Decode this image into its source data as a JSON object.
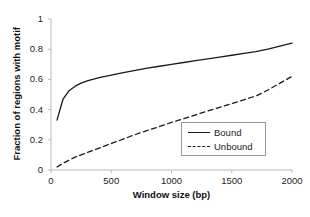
{
  "chart_data": {
    "type": "line",
    "title": "",
    "xlabel": "Window size (bp)",
    "ylabel": "Fraction of regions with motif",
    "xlim": [
      0,
      2000
    ],
    "ylim": [
      0,
      1
    ],
    "xticks": [
      0,
      500,
      1000,
      1500,
      2000
    ],
    "yticks": [
      0,
      0.2,
      0.4,
      0.6,
      0.8,
      1
    ],
    "xtick_labels": [
      "0",
      "500",
      "1000",
      "1500",
      "2000"
    ],
    "ytick_labels": [
      "0",
      "0.2",
      "0.4",
      "0.6",
      "0.8",
      "1"
    ],
    "grid": false,
    "legend_position": "inside-lower-right",
    "x": [
      50,
      100,
      150,
      200,
      250,
      300,
      400,
      500,
      600,
      700,
      800,
      900,
      1000,
      1100,
      1200,
      1300,
      1400,
      1500,
      1600,
      1700,
      1800,
      1900,
      2000
    ],
    "series": [
      {
        "name": "Bound",
        "style": "solid",
        "color": "#1a1a1a",
        "values": [
          0.33,
          0.47,
          0.525,
          0.555,
          0.575,
          0.59,
          0.612,
          0.628,
          0.645,
          0.66,
          0.674,
          0.687,
          0.7,
          0.712,
          0.724,
          0.736,
          0.748,
          0.76,
          0.772,
          0.784,
          0.8,
          0.82,
          0.84
        ]
      },
      {
        "name": "Unbound",
        "style": "dashed",
        "color": "#1a1a1a",
        "values": [
          0.02,
          0.045,
          0.065,
          0.085,
          0.1,
          0.115,
          0.145,
          0.175,
          0.205,
          0.235,
          0.262,
          0.288,
          0.315,
          0.34,
          0.365,
          0.39,
          0.415,
          0.44,
          0.465,
          0.49,
          0.53,
          0.575,
          0.62
        ]
      }
    ]
  },
  "legend": {
    "entries": [
      {
        "label": "Bound",
        "style": "solid"
      },
      {
        "label": "Unbound",
        "style": "dashed"
      }
    ]
  },
  "artifact": {
    "text": ""
  }
}
